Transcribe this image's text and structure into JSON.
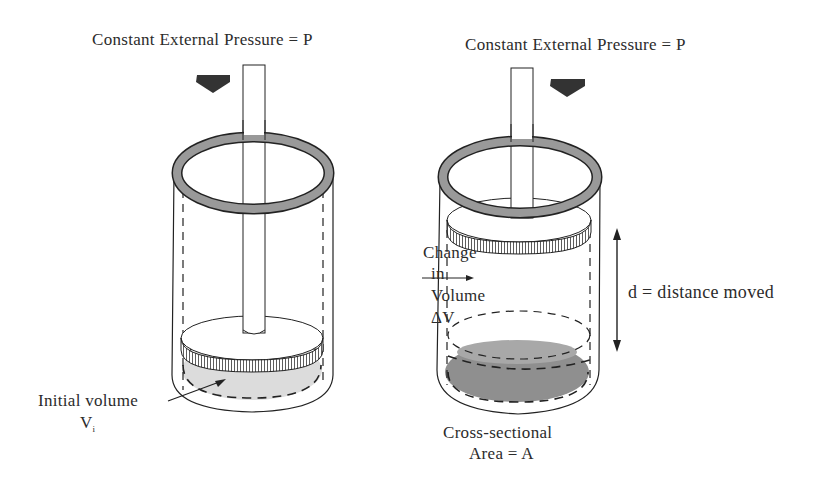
{
  "left_diagram": {
    "title": "Constant External Pressure = P",
    "initial_volume_label": "Initial volume",
    "initial_volume_symbol": "V",
    "initial_volume_subscript": "i"
  },
  "middle_labels": {
    "change_line1": "Change",
    "change_line2": "in",
    "change_line3": "Volume",
    "change_line4": "ΔV"
  },
  "right_diagram": {
    "title": "Constant External Pressure = P",
    "distance_label": "d = distance moved",
    "area_line1": "Cross-sectional",
    "area_line2": "Area = A"
  },
  "colors": {
    "line": "#222222",
    "ring": "#8a8a8a",
    "gas_light": "#d8d8d8",
    "gas_dark": "#8f8f8f",
    "arrow": "#333333"
  }
}
